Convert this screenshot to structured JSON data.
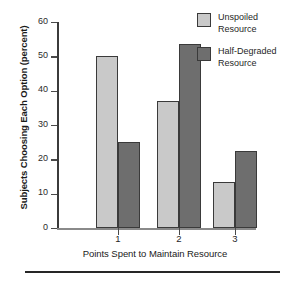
{
  "chart_data": {
    "type": "bar",
    "title": "",
    "xlabel": "Points Spent to Maintain Resource",
    "ylabel": "Subjects Choosing Each Option (percent)",
    "categories": [
      "1",
      "2",
      "3"
    ],
    "series": [
      {
        "name": "Unspoiled Resource",
        "values": [
          50,
          37,
          13.5
        ],
        "color": "#c9c9c9"
      },
      {
        "name": "Half-Degraded Resource",
        "values": [
          25,
          53.5,
          22.5
        ],
        "color": "#6e6e6e"
      }
    ],
    "ylim": [
      0,
      60
    ],
    "yticks": [
      0,
      10,
      20,
      30,
      40,
      50,
      60
    ],
    "ytick_labels": [
      "0",
      "10",
      "20",
      "30",
      "40",
      "50",
      "60"
    ],
    "grid": false,
    "legend_position": "top-right",
    "legend": [
      {
        "line1": "Unspoiled",
        "line2": "Resource"
      },
      {
        "line1": "Half-Degraded",
        "line2": "Resource"
      }
    ]
  },
  "colors": {
    "series_light": "#c9c9c9",
    "series_dark": "#6e6e6e",
    "bar_outline": "#3a3a3a",
    "axis": "#3b3b3b",
    "rule": "#262626"
  }
}
